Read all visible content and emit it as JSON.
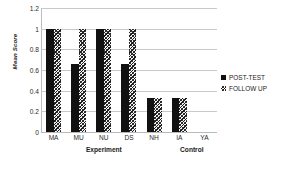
{
  "chart_data": {
    "type": "bar",
    "title": "",
    "xlabel": "",
    "ylabel": "Mean Score",
    "ylim": [
      0,
      1.2
    ],
    "yticks": [
      "0",
      "0.2",
      "0.4",
      "0.6",
      "0.8",
      "1",
      "1.2"
    ],
    "ytick_values": [
      0,
      0.2,
      0.4,
      0.6,
      0.8,
      1.0,
      1.2
    ],
    "grid": "horizontal",
    "legend_position": "right",
    "categories": [
      "MA",
      "MU",
      "NU",
      "DS",
      "NH",
      "IA",
      "YA"
    ],
    "series": [
      {
        "name": "POST-TEST",
        "pattern": "solid-black",
        "color": "#111111",
        "values": [
          1.0,
          0.66,
          1.0,
          0.66,
          0.33,
          0.33,
          0
        ]
      },
      {
        "name": "FOLLOW UP",
        "pattern": "diagonal-hatch",
        "color": "#1d1d1d",
        "values": [
          1.0,
          1.0,
          1.0,
          1.0,
          0.33,
          0.33,
          0
        ]
      }
    ],
    "groups": [
      {
        "label": "Experiment",
        "categories": [
          "MA",
          "MU",
          "NU",
          "DS",
          "NH"
        ]
      },
      {
        "label": "Control",
        "categories": [
          "IA",
          "YA"
        ]
      }
    ]
  },
  "legend": {
    "entries": [
      {
        "label": "POST-TEST"
      },
      {
        "label": "FOLLOW UP"
      }
    ]
  }
}
